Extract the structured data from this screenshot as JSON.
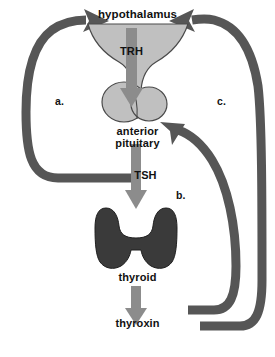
{
  "diagram": {
    "colors": {
      "background": "#ffffff",
      "organ_light": "#c0c0c0",
      "organ_outline": "#4a4a4a",
      "organ_dark": "#3a3a3a",
      "arrow_grey": "#8c8c8c",
      "feedback_arrow": "#565656",
      "text": "#111111"
    },
    "organs": [
      {
        "id": "hypothalamus",
        "label": "hypothalamus",
        "fill": "#c0c0c0",
        "shape": "funnel"
      },
      {
        "id": "anterior-pituitary",
        "label": "anterior\npituitary",
        "fill": "#c0c0c0",
        "shape": "two-lobes"
      },
      {
        "id": "thyroid",
        "label": "thyroid",
        "fill": "#3a3a3a",
        "shape": "butterfly"
      }
    ],
    "hormones": [
      {
        "id": "trh",
        "label": "TRH",
        "from": "hypothalamus",
        "to": "anterior-pituitary"
      },
      {
        "id": "tsh",
        "label": "TSH",
        "from": "anterior-pituitary",
        "to": "thyroid"
      },
      {
        "id": "thyroxin",
        "label": "thyroxin",
        "from": "thyroid",
        "to": "target"
      }
    ],
    "feedback_arrows": [
      {
        "id": "a",
        "label": "a.",
        "from": "TSH",
        "to": "hypothalamus",
        "side": "left"
      },
      {
        "id": "b",
        "label": "b.",
        "from": "thyroxin",
        "to": "anterior pituitary",
        "side": "right-inner"
      },
      {
        "id": "c",
        "label": "c.",
        "from": "thyroxin",
        "to": "hypothalamus",
        "side": "right-outer"
      }
    ]
  }
}
